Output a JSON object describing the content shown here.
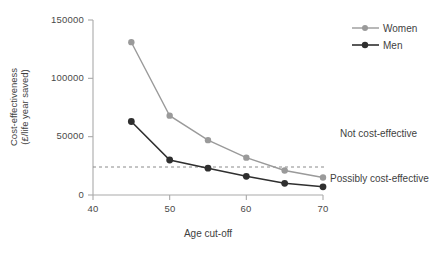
{
  "chart_data": {
    "type": "line",
    "title": "",
    "xlabel": "Age cut-off",
    "ylabel_line1": "Cost-effectiveness",
    "ylabel_line2": "(£/life year saved)",
    "x": [
      45,
      50,
      55,
      60,
      65,
      70
    ],
    "xlim": [
      40,
      71
    ],
    "ylim": [
      0,
      150000
    ],
    "xticks": [
      "40",
      "50",
      "60",
      "70"
    ],
    "xtick_values": [
      40,
      50,
      60,
      70
    ],
    "yticks": [
      "0",
      "50000",
      "100000",
      "150000"
    ],
    "ytick_values": [
      0,
      50000,
      100000,
      150000
    ],
    "grid": false,
    "legend_position": "top-right",
    "series": [
      {
        "name": "Women",
        "color": "#9a9a9a",
        "values": [
          131000,
          68000,
          47000,
          32000,
          21000,
          15000
        ]
      },
      {
        "name": "Men",
        "color": "#2f2f2f",
        "values": [
          63000,
          30000,
          23000,
          16000,
          10000,
          7000
        ]
      }
    ],
    "threshold_line": {
      "value": 24000,
      "style": "dashed",
      "color": "#8a8a8a"
    },
    "annotations": [
      {
        "text": "Not cost-effective",
        "y": 52000
      },
      {
        "text": "Possibly cost-effective",
        "y": 14000
      }
    ]
  },
  "legend": {
    "women_label": "Women",
    "men_label": "Men"
  },
  "axes": {
    "x_label": "Age cut-off",
    "y_label_line1": "Cost-effectiveness",
    "y_label_line2": "(£/life year saved)",
    "ytick_0": "0",
    "ytick_1": "50000",
    "ytick_2": "100000",
    "ytick_3": "150000",
    "xtick_0": "40",
    "xtick_1": "50",
    "xtick_2": "60",
    "xtick_3": "70"
  },
  "annotations": {
    "not_cost_effective": "Not cost-effective",
    "possibly_cost_effective": "Possibly cost-effective"
  }
}
